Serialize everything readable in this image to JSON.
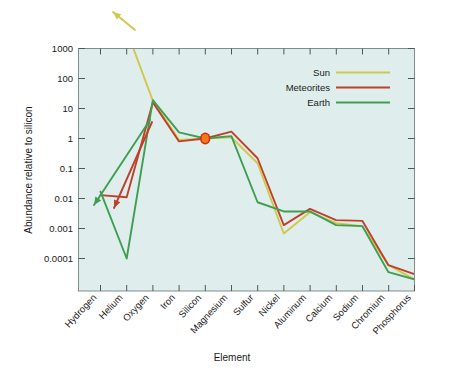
{
  "chart_data": {
    "type": "line",
    "title": "",
    "xlabel": "Element",
    "ylabel": "Abundance relative to silicon",
    "yscale": "log",
    "ylim": [
      2e-05,
      1000
    ],
    "grid": false,
    "legend_position": "top-right",
    "background_color": "#dfeeec",
    "categories": [
      "Hydrogen",
      "Helium",
      "Oxygen",
      "Iron",
      "Silicon",
      "Magnesium",
      "Sulfur",
      "Nickel",
      "Aluminum",
      "Calcium",
      "Sodium",
      "Chromium",
      "Phosphorus"
    ],
    "ytick_labels": [
      "1000",
      "100",
      "10",
      "1",
      "0.1",
      "0.01",
      "0.001",
      "0.0001"
    ],
    "ytick_values": [
      1000,
      100,
      10,
      1,
      0.1,
      0.01,
      0.001,
      0.0001
    ],
    "series": [
      {
        "name": "Sun",
        "color": "#cfc84f",
        "values": [
          null,
          4000,
          18,
          0.9,
          1.0,
          1.1,
          0.15,
          0.00068,
          0.0035,
          0.0015,
          0.0012,
          6e-05,
          2e-05
        ],
        "arrow_note": "line enters plot from upper left, off-scale at Hydrogen/Helium"
      },
      {
        "name": "Meteorites",
        "color": "#c0412b",
        "values": [
          0.013,
          0.011,
          16,
          0.8,
          1.0,
          1.7,
          0.22,
          0.0013,
          0.0045,
          0.0019,
          0.0018,
          6e-05,
          3e-05
        ],
        "arrow_note": "downward arrow at Helium indicating upper limit / off-scale"
      },
      {
        "name": "Earth",
        "color": "#3f9e52",
        "values": [
          0.017,
          0.0001,
          19,
          1.6,
          1.0,
          1.2,
          0.0075,
          0.0037,
          0.0037,
          0.0013,
          0.0012,
          3.5e-05,
          2e-05
        ],
        "arrow_note": "downward arrow at Hydrogen indicating upper limit / off-scale"
      }
    ],
    "markers": [
      {
        "name": "silicon-reference-point",
        "category": "Silicon",
        "value": 1.0,
        "color": "#f07818",
        "edge_color": "#d03010"
      }
    ],
    "legend": [
      {
        "label": "Sun",
        "color": "#cfc84f"
      },
      {
        "label": "Meteorites",
        "color": "#c0412b"
      },
      {
        "label": "Earth",
        "color": "#3f9e52"
      }
    ]
  }
}
